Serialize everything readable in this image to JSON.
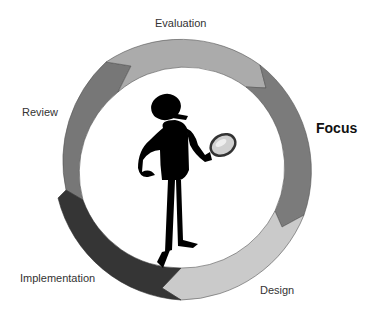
{
  "diagram": {
    "type": "cycle",
    "stages": [
      {
        "label": "Evaluation",
        "color": "#ababab"
      },
      {
        "label": "Focus",
        "color": "#7b7b7b",
        "emphasized": true
      },
      {
        "label": "Design",
        "color": "#cacaca"
      },
      {
        "label": "Implementation",
        "color": "#353535"
      },
      {
        "label": "Review",
        "color": "#777777"
      }
    ],
    "center_figure": "silhouette-person-with-magnifying-glass"
  }
}
